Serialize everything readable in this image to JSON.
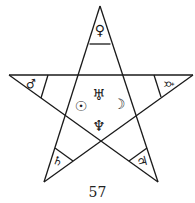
{
  "diagram": {
    "stroke_color": "#1a1a1a",
    "background_color": "#ffffff",
    "points": {
      "top": {
        "planet": "Venus",
        "symbol": "♀"
      },
      "upper_left": {
        "planet": "Mars",
        "symbol": "♂"
      },
      "upper_right": {
        "planet": "Mercury",
        "symbol": "☿"
      },
      "lower_left": {
        "planet": "Saturn",
        "symbol": "♄"
      },
      "lower_right": {
        "planet": "Jupiter",
        "symbol": "♃"
      }
    },
    "center": {
      "top": {
        "planet": "Uranus",
        "symbol": "♅"
      },
      "left": {
        "planet": "Sun",
        "symbol": "☉"
      },
      "right": {
        "planet": "Moon",
        "symbol": "☽"
      },
      "bottom": {
        "planet": "Neptune",
        "symbol": "♆"
      }
    }
  },
  "page_number": "57"
}
